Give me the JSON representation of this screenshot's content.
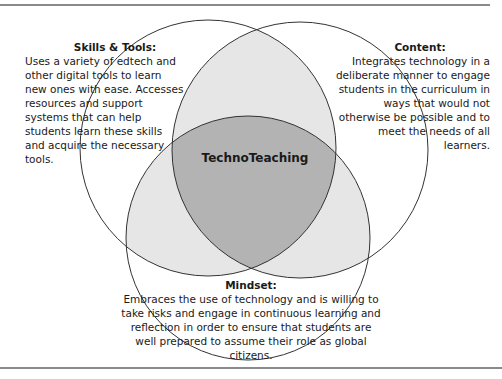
{
  "diagram": {
    "type": "venn",
    "center_label": "TechnoTeaching",
    "sets": [
      {
        "id": "skills",
        "title": "Skills & Tools:",
        "text": "Uses a variety of edtech and other digital tools to learn new ones with ease. Accesses resources and support systems that can help students learn these skills and acquire the necessary tools."
      },
      {
        "id": "content",
        "title": "Content:",
        "text": "Integrates technology in a deliberate manner to engage students in the curriculum in ways that would not otherwise be possible and to meet the needs of all learners."
      },
      {
        "id": "mindset",
        "title": "Mindset:",
        "text": "Embraces the use of technology and is willing to take risks and engage in continuous learning and reflection in order to ensure that students are well prepared to assume their role as global citizens."
      }
    ],
    "colors": {
      "pair_overlap": "#e6e6e6",
      "triple_overlap": "#b3b3b3",
      "outline": "#333333"
    }
  }
}
